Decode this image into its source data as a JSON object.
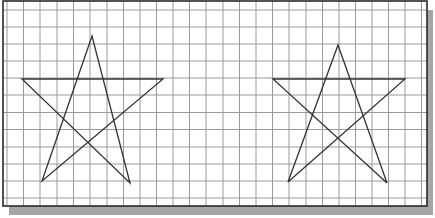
{
  "canvas": {
    "width": 435,
    "height": 218,
    "background": "#ffffff"
  },
  "sheet": {
    "x": 3,
    "y": 1,
    "width": 424,
    "height": 205,
    "border_color": "#2a2a2a",
    "border_width": 1.6,
    "shadow": {
      "dx": 6,
      "dy": 9,
      "color": "#a6a6a6"
    }
  },
  "grid": {
    "x_lines": [
      7,
      23.5,
      40,
      57,
      73.5,
      90,
      107,
      123.5,
      140,
      156.5,
      173,
      189.5,
      206,
      223,
      239.5,
      256,
      272.5,
      289,
      306,
      322.5,
      339,
      355.5,
      372,
      388.5,
      405,
      421.5
    ],
    "y_lines": [
      10,
      27,
      44,
      61,
      78,
      95,
      112.5,
      129.5,
      147,
      164,
      181,
      198
    ],
    "color": "#9a9a9a",
    "width": 1
  },
  "shapes": [
    {
      "name": "left-star",
      "stroke": "#333333",
      "stroke_width": 1.3,
      "points": [
        [
          42,
          181
        ],
        [
          92,
          36
        ],
        [
          130,
          183
        ],
        [
          22,
          79
        ],
        [
          163,
          79
        ]
      ]
    },
    {
      "name": "right-star",
      "stroke": "#333333",
      "stroke_width": 1.3,
      "points": [
        [
          288,
          182
        ],
        [
          338,
          45
        ],
        [
          387,
          183
        ],
        [
          273,
          79
        ],
        [
          405,
          79
        ]
      ]
    }
  ]
}
